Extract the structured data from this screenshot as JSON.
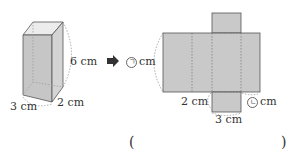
{
  "problem": {
    "box": {
      "height_label": "6 cm",
      "width_label": "3 cm",
      "depth_label": "2 cm"
    },
    "arrow": "➡",
    "net": {
      "unknown_a_symbol": "㉠",
      "unknown_a_unit": "cm",
      "left_bottom_label": "2 cm",
      "bottom_flap_label": "3 cm",
      "unknown_b_symbol": "㉡",
      "unknown_b_unit": "cm"
    },
    "answer": {
      "open_paren": "(",
      "close_paren": ")",
      "value": ""
    }
  },
  "colors": {
    "face_fill": "#c9c9c9",
    "top_fill": "#ececec",
    "edge": "#555555",
    "dashed": "#8a8a8a"
  }
}
